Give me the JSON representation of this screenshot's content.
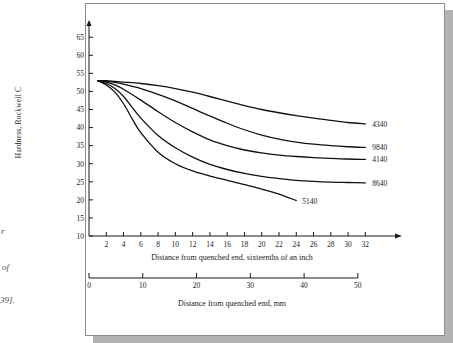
{
  "margin_caption_fragments": [
    "r",
    "of",
    "39]."
  ],
  "chart_data": {
    "type": "line",
    "title": "",
    "xlabel": "Distance from quenched end, sixteenths of an inch",
    "ylabel": "Hardness, Rockwell C",
    "secondary_xlabel": "Distance from quenched end, mm",
    "xlim": [
      0,
      33
    ],
    "ylim": [
      10,
      67
    ],
    "yticks": [
      10,
      15,
      20,
      25,
      30,
      35,
      40,
      45,
      50,
      55,
      60,
      65
    ],
    "xticks": [
      2,
      4,
      6,
      8,
      10,
      12,
      14,
      16,
      18,
      20,
      22,
      24,
      26,
      28,
      30,
      32
    ],
    "secondary_xticks": [
      0,
      10,
      20,
      30,
      40,
      50
    ],
    "secondary_xlim": [
      0,
      53
    ],
    "grid": false,
    "legend": "inline-end-labels",
    "x_unit": "sixteenths of an inch",
    "y_unit": "HRC",
    "series": [
      {
        "name": "4340",
        "label": "4340",
        "x": [
          1,
          2,
          3,
          4,
          6,
          8,
          10,
          12,
          14,
          16,
          18,
          20,
          22,
          24,
          26,
          28,
          30,
          32
        ],
        "values": [
          53,
          53,
          52.8,
          52.6,
          52.2,
          51.6,
          50.8,
          49.8,
          48.6,
          47.3,
          46.1,
          45.0,
          44.1,
          43.3,
          42.6,
          42.0,
          41.4,
          41.0
        ]
      },
      {
        "name": "9840",
        "label": "9840",
        "x": [
          1,
          2,
          3,
          4,
          6,
          8,
          10,
          12,
          14,
          16,
          18,
          20,
          22,
          24,
          26,
          28,
          30,
          32
        ],
        "values": [
          53,
          52.8,
          52.5,
          52.0,
          50.8,
          49.2,
          47.4,
          45.3,
          43.2,
          41.2,
          39.4,
          37.9,
          36.8,
          36.0,
          35.4,
          35.0,
          34.7,
          34.5
        ]
      },
      {
        "name": "4140",
        "label": "4140",
        "x": [
          1,
          2,
          3,
          4,
          6,
          8,
          10,
          12,
          14,
          16,
          18,
          20,
          22,
          24,
          26,
          28,
          30,
          32
        ],
        "values": [
          53,
          52.6,
          51.8,
          50.6,
          47.6,
          44.4,
          41.4,
          38.8,
          36.6,
          35.0,
          33.8,
          33.0,
          32.4,
          32.0,
          31.7,
          31.5,
          31.3,
          31.2
        ]
      },
      {
        "name": "8640",
        "label": "8640",
        "x": [
          1,
          2,
          3,
          4,
          5,
          6,
          8,
          10,
          12,
          14,
          16,
          18,
          20,
          22,
          24,
          26,
          28,
          30,
          32
        ],
        "values": [
          53,
          52.2,
          50.8,
          48.6,
          45.6,
          42.6,
          37.8,
          34.4,
          31.8,
          29.8,
          28.4,
          27.3,
          26.5,
          25.9,
          25.4,
          25.1,
          24.9,
          24.8,
          24.7
        ]
      },
      {
        "name": "5140",
        "label": "5140",
        "x": [
          1,
          2,
          3,
          4,
          5,
          6,
          8,
          10,
          12,
          14,
          16,
          18,
          20,
          22,
          24
        ],
        "values": [
          53,
          51.8,
          49.8,
          46.6,
          42.4,
          38.6,
          33.2,
          30.0,
          28.0,
          26.6,
          25.4,
          24.2,
          23.0,
          21.6,
          19.8
        ]
      }
    ]
  }
}
